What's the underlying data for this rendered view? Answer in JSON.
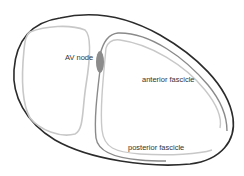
{
  "diagram": {
    "type": "anatomical-schematic",
    "labels": {
      "av_node": "AV node",
      "anterior_fascicle": "anterior fascicle",
      "posterior_fascicle": "posterior fascicle"
    },
    "colors": {
      "outer_outline": "#2b2b2b",
      "chamber_outline": "#c8c8c8",
      "fascicle": "#8a8a8a",
      "av_node_fill": "#8c8c8c",
      "text": "#333333",
      "background": "#ffffff"
    }
  }
}
